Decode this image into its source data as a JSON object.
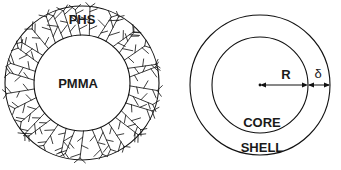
{
  "figure": {
    "width": 341,
    "height": 170,
    "background": "#ffffff",
    "stroke_color": "#111111",
    "text_color": "#1a1a1a"
  },
  "left_diagram": {
    "name": "polymer-brush-particle",
    "center": {
      "x": 82,
      "y": 83
    },
    "outer_radius": 77,
    "inner_radius": 48,
    "shell_label": "PHS",
    "core_label": "PMMA",
    "shell_label_pos": {
      "x": 82,
      "y": 24
    },
    "core_label_pos": {
      "x": 78,
      "y": 88
    },
    "chain_count": 34,
    "chain_branches": 3
  },
  "right_diagram": {
    "name": "core-shell-schematic",
    "center": {
      "x": 260,
      "y": 85
    },
    "outer_radius": 70,
    "inner_radius": 48,
    "core_label": "CORE",
    "shell_label": "SHELL",
    "core_label_pos": {
      "x": 262,
      "y": 127
    },
    "shell_label_pos": {
      "x": 262,
      "y": 152
    },
    "radius_label": "R",
    "radius_label_pos": {
      "x": 286,
      "y": 79
    },
    "thickness_label": "δ",
    "thickness_label_pos": {
      "x": 317,
      "y": 79
    },
    "dimension_line_y": 85,
    "radius_arrow": {
      "x1": 260,
      "x2": 308
    },
    "thickness_arrow": {
      "x1": 308,
      "x2": 330
    }
  }
}
